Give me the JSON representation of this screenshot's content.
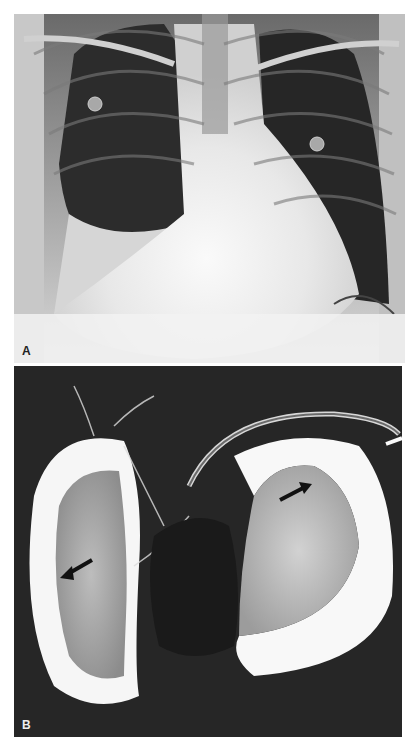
{
  "figure": {
    "panels": [
      {
        "label": "A",
        "description": "Frontal chest radiograph",
        "markers": [
          "right lung ECG electrode marker",
          "left lung ECG electrode marker"
        ]
      },
      {
        "label": "B",
        "description": "Contrast angiogram with catheter",
        "arrows": [
          {
            "direction": "down-left",
            "tip": [
              62,
              578
            ],
            "tail": [
              92,
              560
            ]
          },
          {
            "direction": "up-right",
            "tip": [
              311,
              484
            ],
            "tail": [
              280,
              500
            ]
          }
        ]
      }
    ],
    "colors": {
      "background": "#ffffff",
      "film_dark": "#1e1e1e",
      "film_bright": "#f4f4f4"
    }
  }
}
